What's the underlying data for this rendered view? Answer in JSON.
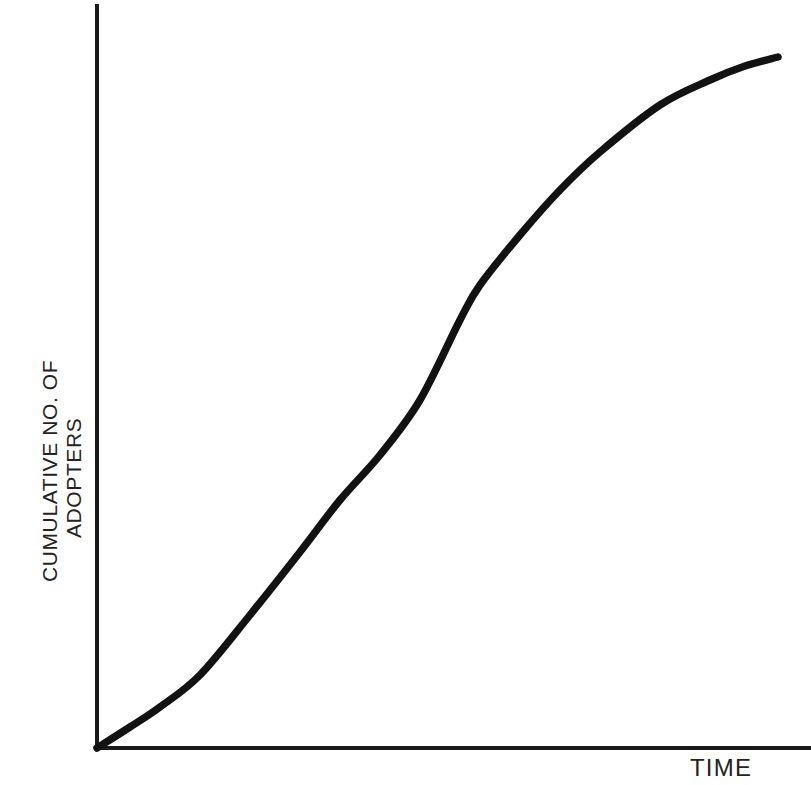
{
  "chart_data": {
    "type": "line",
    "title": "",
    "subtitle": "",
    "xlabel": "TIME",
    "ylabel_line1": "CUMULATIVE NO. OF",
    "ylabel_line2": "ADOPTERS",
    "ylabel_full": "CUMULATIVE NO. OF ADOPTERS",
    "grid": false,
    "legend": "none",
    "axis_ticks": "none",
    "tick_labels": [],
    "annotations": [],
    "xlim": [
      0,
      100
    ],
    "ylim": [
      0,
      100
    ],
    "series": [
      {
        "name": "Cumulative adopters",
        "color": "#121212",
        "shape": "s-curve",
        "x": [
          0,
          5,
          10,
          15,
          20,
          25,
          30,
          35,
          40,
          45,
          50,
          55,
          60,
          65,
          70,
          75,
          80,
          85,
          90,
          95,
          100
        ],
        "values": [
          0,
          2,
          5,
          9,
          13,
          18,
          24,
          31,
          39,
          48,
          57,
          65,
          72,
          78,
          83,
          87,
          90,
          93,
          95,
          96,
          97
        ]
      }
    ],
    "curve_points_px": [
      [
        97,
        748
      ],
      [
        130,
        727
      ],
      [
        160,
        707
      ],
      [
        200,
        675
      ],
      [
        250,
        615
      ],
      [
        300,
        552
      ],
      [
        340,
        500
      ],
      [
        380,
        455
      ],
      [
        420,
        400
      ],
      [
        460,
        320
      ],
      [
        480,
        285
      ],
      [
        520,
        235
      ],
      [
        560,
        190
      ],
      [
        600,
        152
      ],
      [
        660,
        105
      ],
      [
        710,
        80
      ],
      [
        745,
        66
      ],
      [
        778,
        57
      ]
    ],
    "axes_px": {
      "origin": [
        97,
        748
      ],
      "y_axis_top": [
        97,
        4
      ],
      "x_axis_right": [
        811,
        748
      ]
    }
  },
  "colors": {
    "background": "#ffffff",
    "axis": "#1a1a1a",
    "curve": "#121212",
    "label_text": "#232323"
  }
}
